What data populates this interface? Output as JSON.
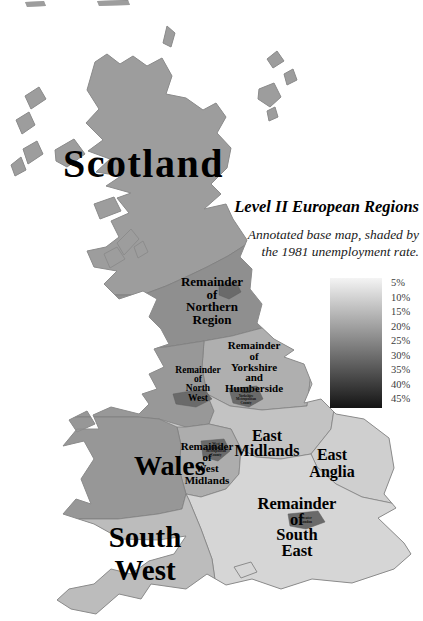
{
  "header": {
    "title": "Level II European Regions",
    "subtitle_line1": "Annotated base map, shaded by",
    "subtitle_line2": "the 1981 unemployment rate."
  },
  "legend": {
    "labels": [
      "5%",
      "10%",
      "15%",
      "20%",
      "25%",
      "30%",
      "35%",
      "40%",
      "45%"
    ],
    "top_color": "#f4f4f4",
    "bottom_color": "#141414"
  },
  "colors": {
    "coastline": "#8c8c8c",
    "region_border": "#7d7d7d",
    "metro": "#6a6a6a",
    "base_land": "#c9c9c9"
  },
  "regions": {
    "scotland": {
      "label": "Scotland",
      "color": "#9d9d9d"
    },
    "northern": {
      "lines": [
        "Remainder",
        "of",
        "Northern",
        "Region"
      ],
      "color": "#8f8f8f"
    },
    "northwest": {
      "lines": [
        "Remainder",
        "of",
        "North",
        "West"
      ],
      "color": "#989898"
    },
    "yorkshire": {
      "lines": [
        "Remainder",
        "of",
        "Yorkshire",
        "and",
        "Humberside"
      ],
      "color": "#afafaf"
    },
    "wales": {
      "label": "Wales",
      "color": "#979797"
    },
    "westmidlands": {
      "lines": [
        "Remainder",
        "of",
        "West",
        "Midlands"
      ],
      "color": "#adadad"
    },
    "eastmidlands": {
      "lines": [
        "East",
        "Midlands"
      ],
      "color": "#c3c3c3"
    },
    "eastanglia": {
      "lines": [
        "East",
        "Anglia"
      ],
      "color": "#cfcfcf"
    },
    "southeast": {
      "lines": [
        "Remainder",
        "of",
        "South",
        "East"
      ],
      "color": "#d6d6d6"
    },
    "southwest": {
      "lines": [
        "South",
        "West"
      ],
      "color": "#bcbcbc"
    }
  },
  "metro_labels": {
    "south_yorkshire": {
      "lines": [
        "South",
        "Yorkshire",
        "Metropolitan",
        "County"
      ]
    },
    "west_midlands": {
      "lines": [
        "West",
        "Midlands",
        "Metropolitan",
        "County"
      ]
    },
    "greater_london": {
      "lines": [
        "Greater",
        "London"
      ]
    }
  }
}
